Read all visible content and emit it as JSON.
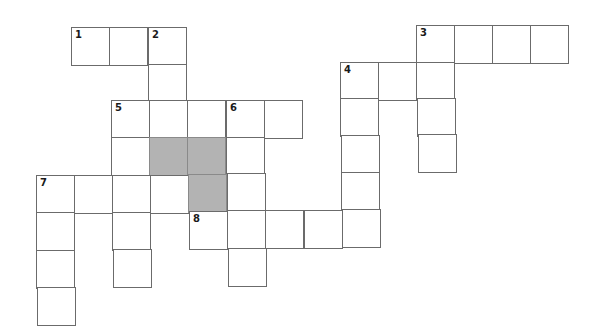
{
  "puzzle": {
    "type": "crossword",
    "cell_size": 38,
    "colors": {
      "border": "#6b6b6b",
      "shaded": "#b3b3b3",
      "background": "#ffffff"
    },
    "cells": [
      {
        "x": 71,
        "y": 27,
        "num": "1"
      },
      {
        "x": 109,
        "y": 27,
        "num": ""
      },
      {
        "x": 148,
        "y": 27,
        "num": "2"
      },
      {
        "x": 416,
        "y": 25,
        "num": "3"
      },
      {
        "x": 454,
        "y": 25,
        "num": ""
      },
      {
        "x": 492,
        "y": 25,
        "num": ""
      },
      {
        "x": 530,
        "y": 25,
        "num": ""
      },
      {
        "x": 148,
        "y": 64,
        "num": ""
      },
      {
        "x": 340,
        "y": 62,
        "num": "4"
      },
      {
        "x": 378,
        "y": 62,
        "num": ""
      },
      {
        "x": 416,
        "y": 62,
        "num": ""
      },
      {
        "x": 111,
        "y": 100,
        "num": "5"
      },
      {
        "x": 149,
        "y": 100,
        "num": ""
      },
      {
        "x": 187,
        "y": 100,
        "num": ""
      },
      {
        "x": 226,
        "y": 100,
        "num": "6"
      },
      {
        "x": 264,
        "y": 100,
        "num": ""
      },
      {
        "x": 340,
        "y": 98,
        "num": ""
      },
      {
        "x": 417,
        "y": 98,
        "num": ""
      },
      {
        "x": 111,
        "y": 137,
        "num": ""
      },
      {
        "x": 149,
        "y": 137,
        "num": "",
        "shaded": true
      },
      {
        "x": 187,
        "y": 137,
        "num": "",
        "shaded": true
      },
      {
        "x": 226,
        "y": 137,
        "num": ""
      },
      {
        "x": 341,
        "y": 135,
        "num": ""
      },
      {
        "x": 418,
        "y": 134,
        "num": ""
      },
      {
        "x": 36,
        "y": 175,
        "num": "7"
      },
      {
        "x": 74,
        "y": 175,
        "num": ""
      },
      {
        "x": 112,
        "y": 175,
        "num": ""
      },
      {
        "x": 150,
        "y": 175,
        "num": ""
      },
      {
        "x": 188,
        "y": 174,
        "num": "",
        "shaded": true
      },
      {
        "x": 227,
        "y": 173,
        "num": ""
      },
      {
        "x": 341,
        "y": 172,
        "num": ""
      },
      {
        "x": 36,
        "y": 212,
        "num": ""
      },
      {
        "x": 112,
        "y": 212,
        "num": ""
      },
      {
        "x": 189,
        "y": 211,
        "num": "8"
      },
      {
        "x": 227,
        "y": 210,
        "num": ""
      },
      {
        "x": 265,
        "y": 210,
        "num": ""
      },
      {
        "x": 304,
        "y": 210,
        "num": ""
      },
      {
        "x": 342,
        "y": 209,
        "num": ""
      },
      {
        "x": 36,
        "y": 250,
        "num": ""
      },
      {
        "x": 113,
        "y": 249,
        "num": ""
      },
      {
        "x": 228,
        "y": 248,
        "num": ""
      },
      {
        "x": 37,
        "y": 287,
        "num": ""
      }
    ]
  }
}
